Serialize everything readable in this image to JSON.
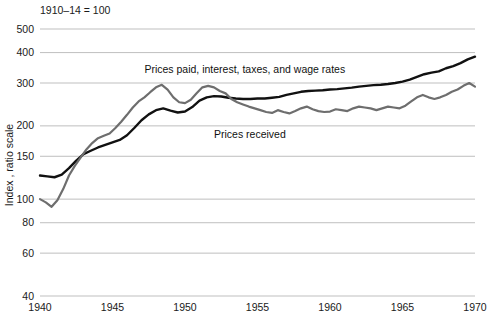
{
  "chart_data": {
    "type": "line",
    "title": "",
    "unit_note": "1910–14 = 100",
    "xlabel": "",
    "ylabel": "Index , ratio scale",
    "yscale": "log",
    "ylim": [
      40,
      500
    ],
    "xlim": [
      1940,
      1970
    ],
    "grid": true,
    "legend": "inline-annotations",
    "yticks": [
      40,
      60,
      80,
      100,
      150,
      200,
      300,
      400,
      500
    ],
    "ytick_labels": [
      "40",
      "60",
      "80",
      "100",
      "150",
      "200",
      "300",
      "400",
      "500"
    ],
    "xticks": [
      1940,
      1945,
      1950,
      1955,
      1960,
      1965,
      1970
    ],
    "xtick_labels": [
      "1940",
      "1945",
      "1950",
      "1955",
      "1960",
      "1965",
      "1970"
    ],
    "colors": {
      "prices_paid": "#111111",
      "prices_received": "#6e6e6e",
      "grid": "#b8b8b8"
    },
    "series": [
      {
        "name": "Prices paid, interest, taxes, and wage rates",
        "color": "#111111",
        "label_x": 1947.2,
        "label_y": 330,
        "x": [
          1940.0,
          1940.5,
          1941.0,
          1941.5,
          1942.0,
          1942.5,
          1943.0,
          1943.5,
          1944.0,
          1944.5,
          1945.0,
          1945.5,
          1946.0,
          1946.5,
          1947.0,
          1947.5,
          1948.0,
          1948.5,
          1949.0,
          1949.5,
          1950.0,
          1950.5,
          1951.0,
          1951.5,
          1952.0,
          1952.5,
          1953.0,
          1953.5,
          1954.0,
          1954.5,
          1955.0,
          1955.5,
          1956.0,
          1956.5,
          1957.0,
          1957.5,
          1958.0,
          1958.5,
          1959.0,
          1959.5,
          1960.0,
          1960.5,
          1961.0,
          1961.5,
          1962.0,
          1962.5,
          1963.0,
          1963.5,
          1964.0,
          1964.5,
          1965.0,
          1965.5,
          1966.0,
          1966.5,
          1967.0,
          1967.5,
          1968.0,
          1968.5,
          1969.0,
          1969.5,
          1970.0
        ],
        "y": [
          125,
          124,
          123,
          126,
          134,
          144,
          153,
          158,
          163,
          167,
          171,
          175,
          183,
          196,
          211,
          223,
          232,
          236,
          231,
          227,
          229,
          239,
          254,
          262,
          265,
          264,
          261,
          259,
          258,
          258,
          259,
          259,
          261,
          263,
          268,
          272,
          276,
          278,
          279,
          280,
          282,
          283,
          285,
          287,
          290,
          292,
          294,
          295,
          297,
          300,
          304,
          310,
          318,
          326,
          331,
          335,
          345,
          352,
          362,
          375,
          385
        ]
      },
      {
        "name": "Prices received",
        "color": "#6e6e6e",
        "label_x": 1952.0,
        "label_y": 178,
        "x": [
          1940.0,
          1940.4,
          1940.8,
          1941.2,
          1941.6,
          1942.0,
          1942.4,
          1942.8,
          1943.2,
          1943.6,
          1944.0,
          1944.4,
          1944.8,
          1945.2,
          1945.6,
          1946.0,
          1946.4,
          1946.8,
          1947.2,
          1947.6,
          1948.0,
          1948.4,
          1948.8,
          1949.2,
          1949.6,
          1950.0,
          1950.4,
          1950.8,
          1951.2,
          1951.6,
          1952.0,
          1952.4,
          1952.8,
          1953.2,
          1953.6,
          1954.0,
          1954.4,
          1954.8,
          1955.2,
          1955.6,
          1956.0,
          1956.4,
          1956.8,
          1957.2,
          1957.6,
          1958.0,
          1958.4,
          1958.8,
          1959.2,
          1959.6,
          1960.0,
          1960.4,
          1960.8,
          1961.2,
          1961.6,
          1962.0,
          1962.4,
          1962.8,
          1963.2,
          1963.6,
          1964.0,
          1964.4,
          1964.8,
          1965.2,
          1965.6,
          1966.0,
          1966.4,
          1966.8,
          1967.2,
          1967.6,
          1968.0,
          1968.4,
          1968.8,
          1969.2,
          1969.6,
          1970.0
        ],
        "y": [
          100,
          97,
          93,
          99,
          110,
          125,
          137,
          148,
          160,
          170,
          178,
          182,
          186,
          196,
          208,
          222,
          238,
          252,
          262,
          275,
          288,
          295,
          282,
          262,
          250,
          248,
          256,
          272,
          288,
          292,
          288,
          278,
          272,
          258,
          250,
          245,
          240,
          236,
          232,
          228,
          226,
          232,
          228,
          225,
          230,
          236,
          240,
          234,
          230,
          228,
          229,
          234,
          232,
          230,
          236,
          240,
          238,
          236,
          232,
          236,
          240,
          238,
          236,
          242,
          252,
          262,
          268,
          262,
          258,
          262,
          268,
          276,
          282,
          292,
          300,
          290
        ]
      }
    ]
  }
}
